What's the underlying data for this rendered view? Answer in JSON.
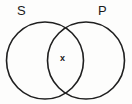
{
  "figure": {
    "type": "venn-diagram",
    "sets": [
      {
        "id": "s",
        "label": "S"
      },
      {
        "id": "p",
        "label": "P"
      }
    ],
    "region_marks": [
      {
        "id": "intersection",
        "label": "x",
        "region": "S-and-P"
      }
    ],
    "colors": {
      "stroke": "#1f1f1f",
      "fill": "none",
      "background": "#fdfdfc",
      "text": "#1a1a1a"
    },
    "geometry": {
      "left_circle": {
        "cx": 45,
        "cy": 60.5,
        "r": 38.5
      },
      "right_circle": {
        "cx": 86,
        "cy": 60.5,
        "r": 38.5
      },
      "stroke_width": 1.6
    }
  }
}
